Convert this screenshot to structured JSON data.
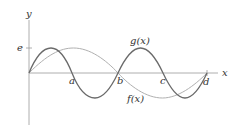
{
  "diagram": {
    "axes": {
      "x_label": "x",
      "y_label": "y",
      "y_tick_label": "e"
    },
    "points": [
      {
        "label": "a"
      },
      {
        "label": "b"
      },
      {
        "label": "c"
      },
      {
        "label": "d"
      }
    ],
    "curves": [
      {
        "name": "g",
        "label": "g(x)",
        "color": "#666666",
        "description": "higher-frequency sine-like curve, amplitude reaching e"
      },
      {
        "name": "f",
        "label": "f(x)",
        "color": "#aaaaaa",
        "description": "lower-frequency sine-like curve, zeros at origin, b, d"
      }
    ],
    "colors": {
      "axis": "#999999",
      "dark_curve": "#666666",
      "light_curve": "#aaaaaa",
      "text": "#333333"
    }
  }
}
